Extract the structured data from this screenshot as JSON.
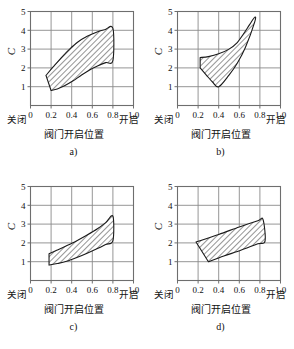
{
  "figure": {
    "type": "multi-panel-chart",
    "panel_count": 4
  },
  "axis": {
    "x_title": "阀门开启位置",
    "x_left_end_label": "关闭",
    "x_right_end_label": "开启",
    "y_title": "C",
    "x_ticks": [
      "0",
      "0.2",
      "0.4",
      "0.6",
      "0.8",
      "1.0"
    ],
    "y_ticks": [
      "1",
      "2",
      "3",
      "4",
      "5"
    ]
  },
  "captions": {
    "a": "a)",
    "b": "b)",
    "c": "c)",
    "d": "d)"
  },
  "colors": {
    "grid": "#8a8a8a",
    "frame": "#6e6e6e",
    "band_outline": "#1a1a1a",
    "hatch": "#2b2b2b",
    "text": "#111111",
    "background": "#ffffff"
  },
  "chart_data": [
    {
      "id": "a",
      "type": "area",
      "title": "a)",
      "xlabel": "阀门开启位置",
      "ylabel": "C",
      "xlim": [
        0,
        1.0
      ],
      "ylim": [
        0,
        5
      ],
      "xticks": [
        0,
        0.2,
        0.4,
        0.6,
        0.8,
        1.0
      ],
      "yticks": [
        1,
        2,
        3,
        4,
        5
      ],
      "grid": true,
      "legend": "none",
      "x_end_labels": [
        "关闭",
        "开启"
      ],
      "band": {
        "name": "流量系数范围带",
        "shape": "S-curve band",
        "upper": {
          "x": [
            0.15,
            0.22,
            0.3,
            0.38,
            0.46,
            0.55,
            0.64,
            0.72,
            0.8
          ],
          "y": [
            1.6,
            2.05,
            2.55,
            3.0,
            3.38,
            3.68,
            3.9,
            4.03,
            4.1
          ]
        },
        "lower": {
          "x": [
            0.2,
            0.26,
            0.33,
            0.41,
            0.49,
            0.57,
            0.65,
            0.73,
            0.8
          ],
          "y": [
            0.8,
            0.88,
            1.05,
            1.3,
            1.6,
            1.88,
            2.1,
            2.28,
            2.4
          ]
        }
      }
    },
    {
      "id": "b",
      "type": "area",
      "title": "b)",
      "xlabel": "阀门开启位置",
      "ylabel": "C",
      "xlim": [
        0,
        1.0
      ],
      "ylim": [
        0,
        5
      ],
      "xticks": [
        0,
        0.2,
        0.4,
        0.6,
        0.8,
        1.0
      ],
      "yticks": [
        1,
        2,
        3,
        4,
        5
      ],
      "grid": true,
      "legend": "none",
      "x_end_labels": [
        "关闭",
        "开启"
      ],
      "band": {
        "name": "流量系数范围带",
        "shape": "upward flaring wedge",
        "upper": {
          "x": [
            0.22,
            0.3,
            0.4,
            0.5,
            0.58,
            0.64,
            0.7,
            0.75
          ],
          "y": [
            2.55,
            2.6,
            2.75,
            3.0,
            3.35,
            3.8,
            4.3,
            4.7
          ]
        },
        "lower": {
          "x": [
            0.22,
            0.28,
            0.34,
            0.4,
            0.5,
            0.58,
            0.66,
            0.75
          ],
          "y": [
            2.0,
            1.62,
            1.25,
            1.0,
            1.62,
            2.25,
            3.1,
            4.45
          ]
        }
      }
    },
    {
      "id": "c",
      "type": "area",
      "title": "c)",
      "xlabel": "阀门开启位置",
      "ylabel": "C",
      "xlim": [
        0,
        1.0
      ],
      "ylim": [
        0,
        5
      ],
      "xticks": [
        0,
        0.2,
        0.4,
        0.6,
        0.8,
        1.0
      ],
      "yticks": [
        1,
        2,
        3,
        4,
        5
      ],
      "grid": true,
      "legend": "none",
      "x_end_labels": [
        "关闭",
        "开启"
      ],
      "band": {
        "name": "流量系数范围带",
        "shape": "rising curved band",
        "upper": {
          "x": [
            0.18,
            0.26,
            0.35,
            0.45,
            0.55,
            0.65,
            0.73,
            0.8
          ],
          "y": [
            1.42,
            1.62,
            1.85,
            2.12,
            2.42,
            2.75,
            3.08,
            3.42
          ]
        },
        "lower": {
          "x": [
            0.18,
            0.26,
            0.35,
            0.45,
            0.55,
            0.65,
            0.73,
            0.8
          ],
          "y": [
            0.82,
            0.9,
            1.02,
            1.22,
            1.45,
            1.7,
            1.92,
            2.12
          ]
        }
      }
    },
    {
      "id": "d",
      "type": "area",
      "title": "d)",
      "xlabel": "阀门开启位置",
      "ylabel": "C",
      "xlim": [
        0,
        1.0
      ],
      "ylim": [
        0,
        5
      ],
      "xticks": [
        0,
        0.2,
        0.4,
        0.6,
        0.8,
        1.0
      ],
      "yticks": [
        1,
        2,
        3,
        4,
        5
      ],
      "grid": true,
      "legend": "none",
      "x_end_labels": [
        "关闭",
        "开启"
      ],
      "band": {
        "name": "流量系数范围带",
        "shape": "straight-sided parallelogram band",
        "upper": {
          "x": [
            0.18,
            0.4,
            0.6,
            0.78,
            0.83
          ],
          "y": [
            2.05,
            2.45,
            2.85,
            3.18,
            3.25
          ]
        },
        "lower": {
          "x": [
            0.3,
            0.45,
            0.62,
            0.78,
            0.85
          ],
          "y": [
            1.0,
            1.3,
            1.62,
            1.95,
            2.1
          ]
        }
      }
    }
  ]
}
